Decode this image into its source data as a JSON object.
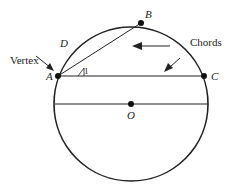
{
  "diagram": {
    "points": {
      "A": {
        "label": "A",
        "x": 58,
        "y": 76
      },
      "B": {
        "label": "B",
        "x": 141,
        "y": 23
      },
      "C": {
        "label": "C",
        "x": 204,
        "y": 76
      },
      "O": {
        "label": "O",
        "x": 131,
        "y": 104
      }
    },
    "circle": {
      "cx": 131,
      "cy": 104,
      "r": 77
    },
    "labels": {
      "vertex": "Vertex",
      "chords": "Chords",
      "arc_point": "D",
      "angle": "1"
    },
    "colors": {
      "stroke": "#222222",
      "background": "#ffffff"
    }
  }
}
